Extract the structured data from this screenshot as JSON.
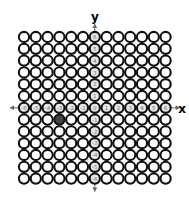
{
  "diagram": {
    "type": "coordinate-circle-grid",
    "x_axis_label": "x",
    "y_axis_label": "y",
    "x_range": [
      -6,
      6
    ],
    "y_range": [
      -6,
      6
    ],
    "columns": 13,
    "rows": 13,
    "x_ticks": [
      "-6",
      "-5",
      "-4",
      "-3",
      "-2",
      "-1",
      "0",
      "1",
      "2",
      "3",
      "4",
      "5",
      "6"
    ],
    "y_ticks": [
      "6",
      "5",
      "4",
      "3",
      "2",
      "1",
      "0",
      "-1",
      "-2",
      "-3",
      "-4",
      "-5",
      "-6"
    ],
    "highlighted_point": {
      "x": -3,
      "y": -1
    },
    "colors": {
      "circle_stroke": "#111111",
      "circle_fill": "#ffffff",
      "axis_circle_fill": "#e6e6e6",
      "axis_label_color": "#777777",
      "highlight_fill": "#444444",
      "axis_arrow": "#666666",
      "axis_letter": "#222222"
    }
  }
}
